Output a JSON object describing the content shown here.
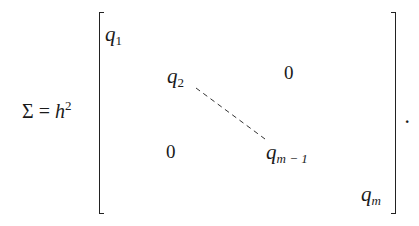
{
  "equation": {
    "lhs_symbol": "Σ",
    "equals": " = ",
    "base": "h",
    "exponent": "2",
    "entries": {
      "q1": {
        "base": "q",
        "sub": "1"
      },
      "q2": {
        "base": "q",
        "sub": "2"
      },
      "qm1": {
        "base": "q",
        "sub": "m − 1"
      },
      "qm": {
        "base": "q",
        "sub": "m"
      }
    },
    "upper_zero": "0",
    "lower_zero": "0",
    "terminator": "."
  }
}
